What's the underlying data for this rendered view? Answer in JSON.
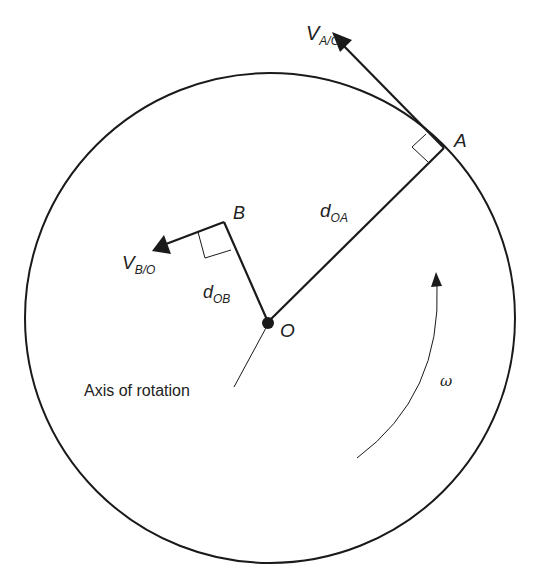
{
  "diagram": {
    "type": "rotating disk kinematics",
    "labels": {
      "point_A": "A",
      "point_B": "B",
      "point_O": "O",
      "v_AO_main": "V",
      "v_AO_sub": "A/O",
      "v_BO_main": "V",
      "v_BO_sub": "B/O",
      "d_OA_main": "d",
      "d_OA_sub": "OA",
      "d_OB_main": "d",
      "d_OB_sub": "OB",
      "axis": "Axis of rotation",
      "omega": "ω"
    },
    "colors": {
      "stroke": "#1a1a1a",
      "background": "#ffffff"
    }
  }
}
